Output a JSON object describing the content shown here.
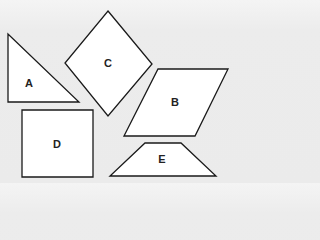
{
  "diagram": {
    "title": "",
    "background_color": "#ececec",
    "fill_color": "#ffffff",
    "stroke_color": "#1a1a1a",
    "shapes": [
      {
        "id": "A",
        "label": "A",
        "type": "right-triangle",
        "points": "8,34 8,102 79,102",
        "label_x": 29,
        "label_y": 83
      },
      {
        "id": "C",
        "label": "C",
        "type": "rhombus",
        "points": "108,11 152,64 108,116 65,63",
        "label_x": 108,
        "label_y": 63
      },
      {
        "id": "B",
        "label": "B",
        "type": "parallelogram",
        "points": "158,69 228,69 195,136 124,136",
        "label_x": 175,
        "label_y": 102
      },
      {
        "id": "D",
        "label": "D",
        "type": "square",
        "points": "22,110 93,110 93,177 22,177",
        "label_x": 57,
        "label_y": 144
      },
      {
        "id": "E",
        "label": "E",
        "type": "trapezoid",
        "points": "145,143 181,143 216,176 110,176",
        "label_x": 162,
        "label_y": 159
      }
    ]
  }
}
